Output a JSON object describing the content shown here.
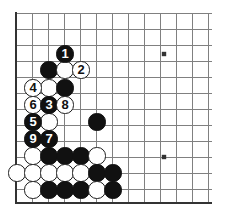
{
  "app": {
    "title": "Go Board Diagram",
    "board_size": 19,
    "visible_region": "top-left corner, 13 columns x 12 rows",
    "background_color": "#ffffff",
    "line_color": "#808080",
    "edge_color": "#333333",
    "black_color": "#111111",
    "white_color": "#ffffff"
  },
  "board": {
    "grid": {
      "origin_x": 16,
      "origin_y": 13,
      "spacing": 16,
      "cols": 13,
      "rows": 12,
      "line_extent_x": 212,
      "line_extent_y": 203,
      "edge_left_x": 16,
      "edge_bottom_y": 203,
      "edge_thickness": 2.5
    },
    "star_points": [
      {
        "name": "hoshi-upper-right-area",
        "x": 164,
        "y": 54
      },
      {
        "name": "hoshi-lower-right-area",
        "x": 164,
        "y": 157
      }
    ],
    "stones": [
      {
        "name": "stone-move-1",
        "color": "black",
        "x": 65,
        "y": 54,
        "label": "1"
      },
      {
        "name": "stone-black-plain-a",
        "color": "black",
        "x": 49,
        "y": 70,
        "label": ""
      },
      {
        "name": "stone-white-plain-a",
        "color": "white",
        "x": 65,
        "y": 70,
        "label": ""
      },
      {
        "name": "stone-move-2",
        "color": "white",
        "x": 81,
        "y": 70,
        "label": "2"
      },
      {
        "name": "stone-move-4",
        "color": "white",
        "x": 33,
        "y": 88,
        "label": "4"
      },
      {
        "name": "stone-white-plain-b",
        "color": "white",
        "x": 49,
        "y": 88,
        "label": ""
      },
      {
        "name": "stone-black-plain-b",
        "color": "black",
        "x": 65,
        "y": 88,
        "label": ""
      },
      {
        "name": "stone-move-6",
        "color": "white",
        "x": 33,
        "y": 105,
        "label": "6"
      },
      {
        "name": "stone-move-3",
        "color": "black",
        "x": 49,
        "y": 105,
        "label": "3"
      },
      {
        "name": "stone-move-8",
        "color": "white",
        "x": 65,
        "y": 105,
        "label": "8"
      },
      {
        "name": "stone-move-5",
        "color": "black",
        "x": 33,
        "y": 122,
        "label": "5"
      },
      {
        "name": "stone-white-plain-c",
        "color": "white",
        "x": 49,
        "y": 122,
        "label": ""
      },
      {
        "name": "stone-black-plain-c",
        "color": "black",
        "x": 97,
        "y": 122,
        "label": ""
      },
      {
        "name": "stone-move-9",
        "color": "black",
        "x": 33,
        "y": 139,
        "label": "9"
      },
      {
        "name": "stone-move-7",
        "color": "black",
        "x": 49,
        "y": 139,
        "label": "7"
      },
      {
        "name": "stone-white-plain-d",
        "color": "white",
        "x": 33,
        "y": 156,
        "label": ""
      },
      {
        "name": "stone-black-plain-d",
        "color": "black",
        "x": 49,
        "y": 156,
        "label": ""
      },
      {
        "name": "stone-black-plain-e",
        "color": "black",
        "x": 65,
        "y": 156,
        "label": ""
      },
      {
        "name": "stone-black-plain-f",
        "color": "black",
        "x": 81,
        "y": 156,
        "label": ""
      },
      {
        "name": "stone-white-plain-e",
        "color": "white",
        "x": 97,
        "y": 156,
        "label": ""
      },
      {
        "name": "stone-white-plain-f",
        "color": "white",
        "x": 17,
        "y": 173,
        "label": ""
      },
      {
        "name": "stone-white-plain-g",
        "color": "white",
        "x": 33,
        "y": 173,
        "label": ""
      },
      {
        "name": "stone-white-plain-h",
        "color": "white",
        "x": 49,
        "y": 173,
        "label": ""
      },
      {
        "name": "stone-white-plain-i",
        "color": "white",
        "x": 65,
        "y": 173,
        "label": ""
      },
      {
        "name": "stone-white-plain-j",
        "color": "white",
        "x": 81,
        "y": 173,
        "label": ""
      },
      {
        "name": "stone-black-plain-g",
        "color": "black",
        "x": 97,
        "y": 173,
        "label": ""
      },
      {
        "name": "stone-black-plain-h",
        "color": "black",
        "x": 113,
        "y": 173,
        "label": ""
      },
      {
        "name": "stone-white-plain-k",
        "color": "white",
        "x": 33,
        "y": 190,
        "label": ""
      },
      {
        "name": "stone-black-plain-i",
        "color": "black",
        "x": 49,
        "y": 190,
        "label": ""
      },
      {
        "name": "stone-black-plain-j",
        "color": "black",
        "x": 65,
        "y": 190,
        "label": ""
      },
      {
        "name": "stone-black-plain-k",
        "color": "black",
        "x": 81,
        "y": 190,
        "label": ""
      },
      {
        "name": "stone-white-plain-l",
        "color": "white",
        "x": 97,
        "y": 190,
        "label": ""
      },
      {
        "name": "stone-black-plain-l",
        "color": "black",
        "x": 113,
        "y": 190,
        "label": ""
      }
    ],
    "stone_radius": 8.6
  }
}
